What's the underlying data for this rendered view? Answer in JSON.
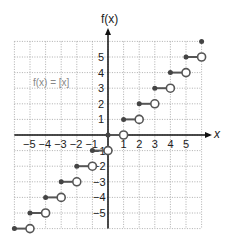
{
  "chart_data": {
    "type": "line",
    "title": "",
    "function_label": "f(x) = [x]",
    "xlabel": "x",
    "ylabel": "f(x)",
    "xlim": [
      -6,
      6
    ],
    "ylim": [
      -6,
      6
    ],
    "grid": true,
    "x_ticks": [
      "-5",
      "-4",
      "-3",
      "-2",
      "-1",
      "1",
      "2",
      "3",
      "4",
      "5"
    ],
    "y_ticks": [
      "5",
      "4",
      "3",
      "2",
      "1",
      "-1",
      "-2",
      "-3",
      "-4",
      "-5"
    ],
    "steps": [
      {
        "x_start": -6,
        "x_end": -5,
        "y": -6
      },
      {
        "x_start": -5,
        "x_end": -4,
        "y": -5
      },
      {
        "x_start": -4,
        "x_end": -3,
        "y": -4
      },
      {
        "x_start": -3,
        "x_end": -2,
        "y": -3
      },
      {
        "x_start": -2,
        "x_end": -1,
        "y": -2
      },
      {
        "x_start": -1,
        "x_end": 0,
        "y": -1
      },
      {
        "x_start": 0,
        "x_end": 1,
        "y": 0
      },
      {
        "x_start": 1,
        "x_end": 2,
        "y": 1
      },
      {
        "x_start": 2,
        "x_end": 3,
        "y": 2
      },
      {
        "x_start": 3,
        "x_end": 4,
        "y": 3
      },
      {
        "x_start": 4,
        "x_end": 5,
        "y": 4
      },
      {
        "x_start": 5,
        "x_end": 6,
        "y": 5
      },
      {
        "x_start": 6,
        "x_end": 6,
        "y": 6
      }
    ],
    "closed_endpoint": "left",
    "open_endpoint": "right"
  },
  "labels": {
    "ylabel": "f(x)",
    "xlabel": "x",
    "equation": "f(x) = [x]"
  }
}
